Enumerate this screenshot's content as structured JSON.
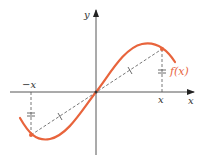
{
  "diagram": {
    "labels": {
      "y_axis": "y",
      "x_axis": "x",
      "neg_x": "−x",
      "pos_x": "x",
      "function": "f(x)"
    },
    "colors": {
      "curve": "#e8643c",
      "axis": "#333333",
      "dashed": "#444444"
    },
    "points": {
      "origin": [
        96,
        92
      ],
      "right_point": [
        162,
        49
      ],
      "left_point": [
        31,
        135
      ]
    }
  }
}
